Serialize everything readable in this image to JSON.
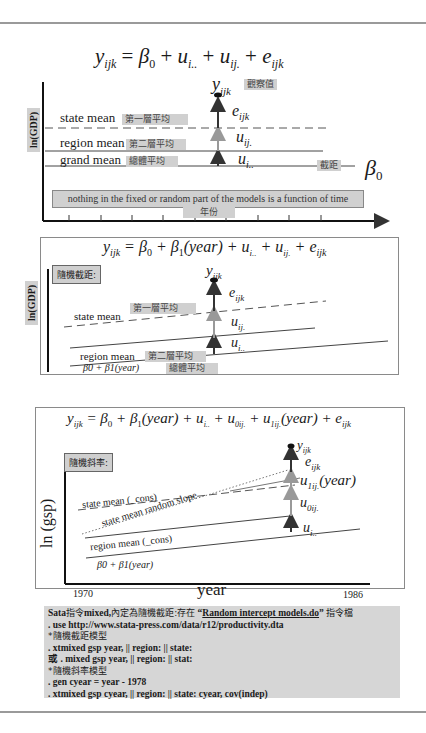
{
  "panel1": {
    "equation": "y_ijk = β0 + u_i.. + u_ij. + e_ijk",
    "eq_parts": {
      "y": "y",
      "y_sub": "ijk",
      "eq": " = ",
      "b0": "β",
      "b0_sub": "0",
      "plus1": " + ",
      "u1": "u",
      "u1_sub": "i..",
      "plus2": " + ",
      "u2": "u",
      "u2_sub": "ij.",
      "plus3": " + ",
      "e": "e",
      "e_sub": "ijk"
    },
    "y_axis_label": "ln(GDP)",
    "observed_label": {
      "symbol": "y",
      "sub": "ijk",
      "tag": "觀察值"
    },
    "lines": [
      {
        "label": "state mean",
        "tag": "第一層平均",
        "style": "dashed"
      },
      {
        "label": "region mean",
        "tag": "第二層平均",
        "style": "solid"
      },
      {
        "label": "grand mean",
        "tag": "總體平均",
        "style": "solid"
      }
    ],
    "components": [
      {
        "symbol": "e",
        "sub": "ijk"
      },
      {
        "symbol": "u",
        "sub": "ij."
      },
      {
        "symbol": "u",
        "sub": "i.."
      }
    ],
    "intercept_tag": "截距",
    "intercept_symbol": "β",
    "intercept_sub": "0",
    "note": "nothing in the fixed or random part of the models is a function of time",
    "x_axis_tag": "年份"
  },
  "panel2": {
    "equation_parts": {
      "y": "y",
      "y_sub": "ijk",
      "rest1": " = β",
      "b0_sub": "0",
      "rest2": " + β",
      "b1_sub": "1",
      "rest3": "(year) + u",
      "u1_sub": "i..",
      "rest4": " + u",
      "u2_sub": "ij.",
      "rest5": " + e",
      "e_sub": "ijk"
    },
    "box_label": "隨機截距:",
    "y_axis_label": "ln(GDP)",
    "observed": {
      "symbol": "y",
      "sub": "ijk"
    },
    "lines": [
      {
        "label": "state mean",
        "tag": "第一層平均"
      },
      {
        "label": "region mean",
        "tag": "第二層平均"
      },
      {
        "label": "β0 + β1(year)",
        "tag": "總體平均"
      }
    ],
    "components": [
      {
        "symbol": "e",
        "sub": "ijk"
      },
      {
        "symbol": "u",
        "sub": "ij."
      },
      {
        "symbol": "u",
        "sub": "i.."
      }
    ]
  },
  "panel3": {
    "equation_parts": {
      "y": "y",
      "y_sub": "ijk",
      "rest1": " = β",
      "b0_sub": "0",
      "rest2": " + β",
      "b1_sub": "1",
      "rest3": "(year) + u",
      "u1_sub": "i..",
      "rest4": " + u",
      "u0_sub": "0ij.",
      "rest5": " + u",
      "u1j_sub": "1ij.",
      "rest6": "(year) + e",
      "e_sub": "ijk"
    },
    "box_label": "隨機斜率:",
    "y_axis_label": "ln (gsp)",
    "x_axis_label": "year",
    "x_start": "1970",
    "x_end": "1986",
    "observed": {
      "symbol": "y",
      "sub": "ijk"
    },
    "lines": [
      {
        "label": "state mean (_cons)",
        "style": "dashed"
      },
      {
        "label": "state mean random slope",
        "style": "dotted"
      },
      {
        "label": "region mean (_cons)",
        "style": "solid"
      },
      {
        "label": "β0 + β1(year)",
        "style": "solid"
      }
    ],
    "components": [
      {
        "symbol": "e",
        "sub": "ijk"
      },
      {
        "symbol": "u",
        "sub": "1ij.",
        "suffix": "(year)"
      },
      {
        "symbol": "u",
        "sub": "0ij."
      },
      {
        "symbol": "u",
        "sub": "i.."
      }
    ]
  },
  "code_block": {
    "line1_prefix": "Sata",
    "line1_cjk1": "指令",
    "line1_mid": "mixed,",
    "line1_cjk2": "內定為隨機截距:存在",
    "line1_quote_open": " “",
    "line1_link": "Random intercept models.do",
    "line1_quote_close": "” ",
    "line1_cjk3": "指令檔",
    "lines": [
      ". use http://www.stata-press.com/data/r12/productivity.dta",
      "*隨機截距模型",
      ". xtmixed gsp year, || region: || state:",
      "或 . mixed gsp year, || region: || stat:",
      "*隨機斜率模型",
      ". gen cyear = year - 1978",
      ". xtmixed gsp cyear, || region: || state: cyear, cov(indep)"
    ]
  }
}
